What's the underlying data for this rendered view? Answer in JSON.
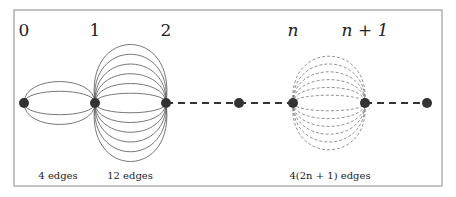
{
  "diagram": {
    "node_labels": [
      {
        "id": "0",
        "text": "0",
        "x": 24
      },
      {
        "id": "1",
        "text": "1",
        "x": 95
      },
      {
        "id": "2",
        "text": "2",
        "x": 166
      },
      {
        "id": "n",
        "text": "n",
        "x": 293
      },
      {
        "id": "n1",
        "text": "n + 1",
        "x": 365
      }
    ],
    "edge_labels": [
      {
        "text": "4 edges",
        "x": 58
      },
      {
        "text": "12 edges",
        "x": 130
      },
      {
        "text": "4(2n + 1) edges",
        "x": 330
      }
    ],
    "nodes_x": [
      24,
      95,
      166,
      239,
      293,
      365,
      427
    ],
    "node_y": 103,
    "colors": {
      "node": "#333333",
      "edge": "#555555",
      "border": "#888888"
    }
  }
}
